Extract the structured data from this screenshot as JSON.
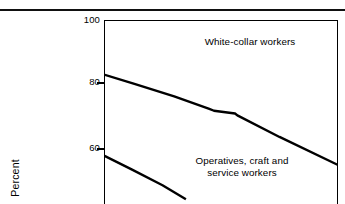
{
  "figure": {
    "background": "#ffffff",
    "ink_color": "#000000",
    "top_rule": "horizontal-rule"
  },
  "axes": {
    "ylabel": "Percent",
    "yticks": [
      {
        "value": 100,
        "label": "100"
      },
      {
        "value": 80,
        "label": "80"
      },
      {
        "value": 60,
        "label": "60"
      }
    ],
    "ylim_top": 100,
    "ylim_visible_bottom": 41,
    "grid": false,
    "frame": "left-top-right"
  },
  "annotations": {
    "white_collar": "White-collar workers",
    "operatives": "Operatives, craft and\nservice workers"
  },
  "chart_data": {
    "type": "line",
    "title": "",
    "subtitle": "",
    "xlabel": "",
    "ylabel": "Percent",
    "ylim": [
      41,
      100
    ],
    "yticks": [
      60,
      80,
      100
    ],
    "grid": false,
    "legend_position": "inline-annotation",
    "note": "Percent values read against the y-axis; x-axis extends past the cropped viewport so x is expressed as fraction of the visible plot width (0 = left frame, 1 = right frame).",
    "series": [
      {
        "name": "White-collar workers",
        "color": "#000000",
        "line_width": 2.4,
        "x": [
          0.0,
          0.13,
          0.3,
          0.45,
          0.47,
          0.56,
          0.57,
          0.75,
          1.0
        ],
        "values": [
          82.5,
          79.5,
          75.5,
          71.5,
          70.9,
          70.0,
          69.4,
          62.5,
          53.5
        ]
      },
      {
        "name": "Operatives, craft and service workers",
        "color": "#000000",
        "line_width": 2.4,
        "x": [
          0.0,
          0.12,
          0.25,
          0.35
        ],
        "values": [
          56.5,
          52.0,
          47.0,
          42.5
        ]
      }
    ]
  }
}
